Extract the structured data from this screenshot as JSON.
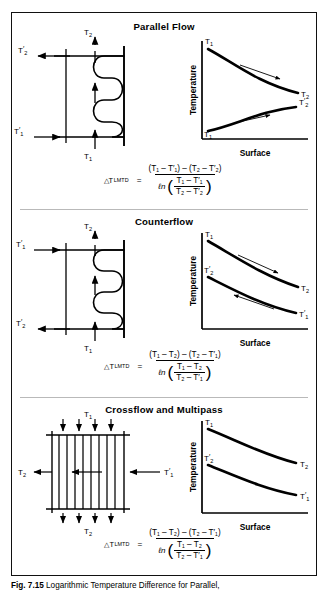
{
  "figure": {
    "caption_label": "Fig. 7.15",
    "caption_text": "Logarithmic Temperature Difference for Parallel,"
  },
  "sections": [
    {
      "id": "parallel-flow",
      "title": "Parallel Flow",
      "schematic": {
        "type": "serpentine-coil",
        "inlet_top_label": "T₂",
        "inlet_bottom_label": "T₁",
        "side_top_label": "T′₂",
        "side_bottom_label": "T′₁",
        "side_top_direction": "out-left",
        "side_bottom_direction": "in-right",
        "vertical_arrows": "upward"
      },
      "chart": {
        "type": "line",
        "ylabel": "Temperature",
        "xlabel": "Surface",
        "curves": [
          {
            "name": "hot-stream",
            "start_label": "T₁",
            "end_label": "T₂",
            "direction": "descending",
            "arrow": "right"
          },
          {
            "name": "cold-stream",
            "start_label": "T′₁",
            "end_label": "T′₂",
            "direction": "ascending",
            "arrow": "right"
          }
        ]
      },
      "formula": {
        "lhs_symbol": "△T",
        "lhs_sub": "LMTD",
        "numerator": "(T₁ – T′₁) – (T₂ – T′₂)",
        "log_inner_num": "T₁ – T′₁",
        "log_inner_den": "T₂ – T′₂"
      }
    },
    {
      "id": "counterflow",
      "title": "Counterflow",
      "schematic": {
        "type": "serpentine-coil",
        "inlet_top_label": "T₂",
        "inlet_bottom_label": "T₁",
        "side_top_label": "T′₁",
        "side_bottom_label": "T′₂",
        "side_top_direction": "in-right",
        "side_bottom_direction": "out-left",
        "vertical_arrows": "upward"
      },
      "chart": {
        "type": "line",
        "ylabel": "Temperature",
        "xlabel": "Surface",
        "curves": [
          {
            "name": "hot-stream",
            "start_label": "T₁",
            "end_label": "T₂",
            "direction": "descending",
            "arrow": "right"
          },
          {
            "name": "cold-stream",
            "start_label": "T′₂",
            "end_label": "T′₁",
            "direction": "descending",
            "arrow": "left"
          }
        ]
      },
      "formula": {
        "lhs_symbol": "△T",
        "lhs_sub": "LMTD",
        "numerator": "(T₁ – T₂) – (T₂ – T′₁)",
        "log_inner_num": "T₁ – T₂",
        "log_inner_den": "T₂ – T′₁"
      }
    },
    {
      "id": "crossflow-multipass",
      "title": "Crossflow and Multipass",
      "schematic": {
        "type": "tube-bank",
        "inlet_top_label": "T₁",
        "inlet_bottom_label": "T₂",
        "side_left_label": "T₂",
        "side_right_label": "T′₁",
        "tube_count": 9,
        "top_arrows": "downward",
        "bottom_arrows": "downward",
        "horizontal_arrows": "leftward"
      },
      "chart": {
        "type": "line",
        "ylabel": "Temperature",
        "xlabel": "Surface",
        "curves": [
          {
            "name": "hot-stream",
            "start_label": "T₁",
            "end_label": "T₂",
            "direction": "descending",
            "arrow": "none"
          },
          {
            "name": "cold-stream",
            "start_label": "T′₂",
            "end_label": "T′₁",
            "direction": "descending",
            "arrow": "none"
          }
        ]
      },
      "formula": {
        "lhs_symbol": "△T",
        "lhs_sub": "LMTD",
        "numerator": "(T₁ – T₂) – (T₂ – T′₁)",
        "log_inner_num": "T₁ – T₂",
        "log_inner_den": "T₂ – T′₁"
      }
    }
  ],
  "colors": {
    "ink": "#000000",
    "border": "#111111",
    "divider": "#b9b9b9",
    "background": "#ffffff"
  }
}
